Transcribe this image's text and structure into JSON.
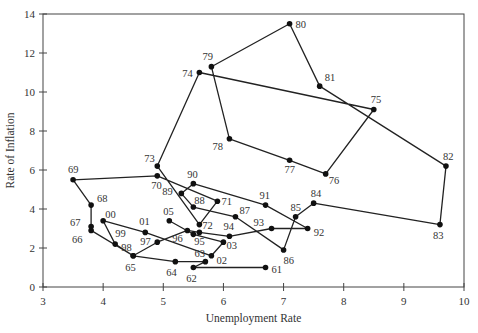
{
  "chart_data": {
    "type": "line",
    "subtype": "connected-scatter",
    "title": "",
    "xlabel": "Unemployment Rate",
    "ylabel": "Rate of Inflation",
    "xlim": [
      3,
      10
    ],
    "ylim": [
      0,
      14
    ],
    "xticks": [
      3,
      4,
      5,
      6,
      7,
      8,
      9,
      10
    ],
    "yticks": [
      0,
      2,
      4,
      6,
      8,
      10,
      12,
      14
    ],
    "grid": false,
    "legend": null,
    "line_color": "#222222",
    "marker_color": "#111111",
    "series": [
      {
        "name": "US Phillips curve 1961-2005",
        "points": [
          {
            "label": "61",
            "x": 6.7,
            "y": 1.0,
            "dx": 6,
            "dy": 5
          },
          {
            "label": "62",
            "x": 5.5,
            "y": 1.0,
            "dx": -7,
            "dy": 14
          },
          {
            "label": "63",
            "x": 5.7,
            "y": 1.3,
            "dx": -11,
            "dy": -5
          },
          {
            "label": "64",
            "x": 5.2,
            "y": 1.3,
            "dx": -9,
            "dy": 14
          },
          {
            "label": "65",
            "x": 4.5,
            "y": 1.6,
            "dx": -8,
            "dy": 15
          },
          {
            "label": "66",
            "x": 3.8,
            "y": 2.9,
            "dx": -19,
            "dy": 13
          },
          {
            "label": "67",
            "x": 3.8,
            "y": 3.1,
            "dx": -21,
            "dy": -1
          },
          {
            "label": "68",
            "x": 3.8,
            "y": 4.2,
            "dx": 6,
            "dy": -3
          },
          {
            "label": "69",
            "x": 3.5,
            "y": 5.5,
            "dx": -5,
            "dy": -7
          },
          {
            "label": "70",
            "x": 4.9,
            "y": 5.7,
            "dx": -6,
            "dy": 13
          },
          {
            "label": "71",
            "x": 5.9,
            "y": 4.4,
            "dx": 4,
            "dy": 4
          },
          {
            "label": "72",
            "x": 5.6,
            "y": 3.2,
            "dx": 3,
            "dy": 4
          },
          {
            "label": "73",
            "x": 4.9,
            "y": 6.2,
            "dx": -13,
            "dy": -4
          },
          {
            "label": "74",
            "x": 5.6,
            "y": 11.0,
            "dx": -17,
            "dy": 4
          },
          {
            "label": "75",
            "x": 8.5,
            "y": 9.1,
            "dx": -3,
            "dy": -7
          },
          {
            "label": "76",
            "x": 7.7,
            "y": 5.8,
            "dx": 3,
            "dy": 10
          },
          {
            "label": "77",
            "x": 7.1,
            "y": 6.5,
            "dx": -5,
            "dy": 13
          },
          {
            "label": "78",
            "x": 6.1,
            "y": 7.6,
            "dx": -17,
            "dy": 11
          },
          {
            "label": "79",
            "x": 5.8,
            "y": 11.3,
            "dx": -9,
            "dy": -7
          },
          {
            "label": "80",
            "x": 7.1,
            "y": 13.5,
            "dx": 6,
            "dy": 4
          },
          {
            "label": "81",
            "x": 7.6,
            "y": 10.3,
            "dx": 5,
            "dy": -5
          },
          {
            "label": "82",
            "x": 9.7,
            "y": 6.2,
            "dx": -3,
            "dy": -6
          },
          {
            "label": "83",
            "x": 9.6,
            "y": 3.2,
            "dx": -7,
            "dy": 14
          },
          {
            "label": "84",
            "x": 7.5,
            "y": 4.3,
            "dx": -3,
            "dy": -6
          },
          {
            "label": "85",
            "x": 7.2,
            "y": 3.6,
            "dx": -5,
            "dy": -6
          },
          {
            "label": "86",
            "x": 7.0,
            "y": 1.9,
            "dx": 0,
            "dy": 14
          },
          {
            "label": "87",
            "x": 6.2,
            "y": 3.6,
            "dx": 4,
            "dy": -3
          },
          {
            "label": "88",
            "x": 5.5,
            "y": 4.1,
            "dx": 1,
            "dy": -3
          },
          {
            "label": "89",
            "x": 5.3,
            "y": 4.8,
            "dx": -19,
            "dy": 2
          },
          {
            "label": "90",
            "x": 5.5,
            "y": 5.3,
            "dx": -6,
            "dy": -6
          },
          {
            "label": "91",
            "x": 6.7,
            "y": 4.2,
            "dx": -6,
            "dy": -6
          },
          {
            "label": "92",
            "x": 7.4,
            "y": 3.0,
            "dx": 6,
            "dy": 7
          },
          {
            "label": "93",
            "x": 6.8,
            "y": 3.0,
            "dx": -18,
            "dy": -3
          },
          {
            "label": "94",
            "x": 6.1,
            "y": 2.6,
            "dx": -6,
            "dy": -6
          },
          {
            "label": "95",
            "x": 5.6,
            "y": 2.8,
            "dx": -5,
            "dy": 13
          },
          {
            "label": "96",
            "x": 5.4,
            "y": 2.9,
            "dx": -15,
            "dy": 12
          },
          {
            "label": "97",
            "x": 4.9,
            "y": 2.3,
            "dx": -17,
            "dy": 3
          },
          {
            "label": "98",
            "x": 4.5,
            "y": 1.6,
            "dx": -12,
            "dy": -5
          },
          {
            "label": "99",
            "x": 4.2,
            "y": 2.2,
            "dx": 0,
            "dy": -7
          },
          {
            "label": "00",
            "x": 4.0,
            "y": 3.4,
            "dx": 2,
            "dy": -3
          },
          {
            "label": "01",
            "x": 4.7,
            "y": 2.8,
            "dx": -6,
            "dy": -7
          },
          {
            "label": "02",
            "x": 5.8,
            "y": 1.6,
            "dx": 5,
            "dy": 8
          },
          {
            "label": "03",
            "x": 6.0,
            "y": 2.3,
            "dx": 3,
            "dy": 7
          },
          {
            "label": "",
            "x": 5.5,
            "y": 2.7,
            "dx": 0,
            "dy": 0
          },
          {
            "label": "05",
            "x": 5.1,
            "y": 3.4,
            "dx": -6,
            "dy": -6
          }
        ]
      }
    ]
  }
}
